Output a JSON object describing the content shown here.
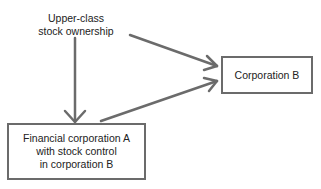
{
  "diagram": {
    "source_node": {
      "lines": [
        "Upper-class",
        "stock ownership"
      ]
    },
    "node_a": {
      "lines": [
        "Financial corporation A",
        "with stock control",
        "in corporation B"
      ]
    },
    "node_b": {
      "label": "Corporation B"
    },
    "edges": [
      {
        "from": "Upper-class stock ownership",
        "to": "Financial corporation A"
      },
      {
        "from": "Upper-class stock ownership",
        "to": "Corporation B"
      },
      {
        "from": "Financial corporation A",
        "to": "Corporation B"
      }
    ],
    "colors": {
      "stroke": "#6b6b6b",
      "text": "#222222",
      "background": "#ffffff"
    }
  }
}
